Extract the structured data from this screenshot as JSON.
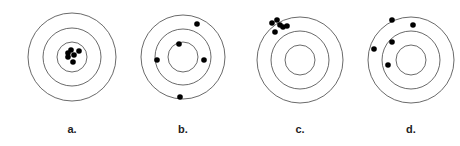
{
  "targets": [
    {
      "id": "a",
      "label": "a.",
      "center": [
        72,
        57
      ],
      "rings": [
        44,
        29,
        15
      ],
      "shots": [
        [
          68,
          53
        ],
        [
          71,
          50
        ],
        [
          74,
          55
        ],
        [
          79,
          51
        ],
        [
          73,
          62
        ],
        [
          68,
          57
        ]
      ],
      "description": "precise and accurate"
    },
    {
      "id": "b",
      "label": "b.",
      "center": [
        183,
        57
      ],
      "rings": [
        42,
        28,
        15
      ],
      "shots": [
        [
          197,
          24
        ],
        [
          179,
          44
        ],
        [
          157,
          60
        ],
        [
          204,
          60
        ],
        [
          180,
          97
        ]
      ],
      "description": "neither precise nor accurate"
    },
    {
      "id": "c",
      "label": "c.",
      "center": [
        300,
        60
      ],
      "rings": [
        43,
        29,
        15
      ],
      "shots": [
        [
          272,
          23
        ],
        [
          277,
          20
        ],
        [
          283,
          27
        ],
        [
          275,
          32
        ],
        [
          280,
          25
        ],
        [
          287,
          26
        ]
      ],
      "description": "precise but not accurate"
    },
    {
      "id": "d",
      "label": "d.",
      "center": [
        411,
        60
      ],
      "rings": [
        43,
        29,
        15
      ],
      "shots": [
        [
          392,
          20
        ],
        [
          413,
          25
        ],
        [
          392,
          42
        ],
        [
          374,
          49
        ],
        [
          388,
          65
        ]
      ],
      "description": "neither precise nor accurate"
    }
  ],
  "colors": {
    "ring": "#444444",
    "shot": "#000000",
    "background": "#ffffff"
  }
}
